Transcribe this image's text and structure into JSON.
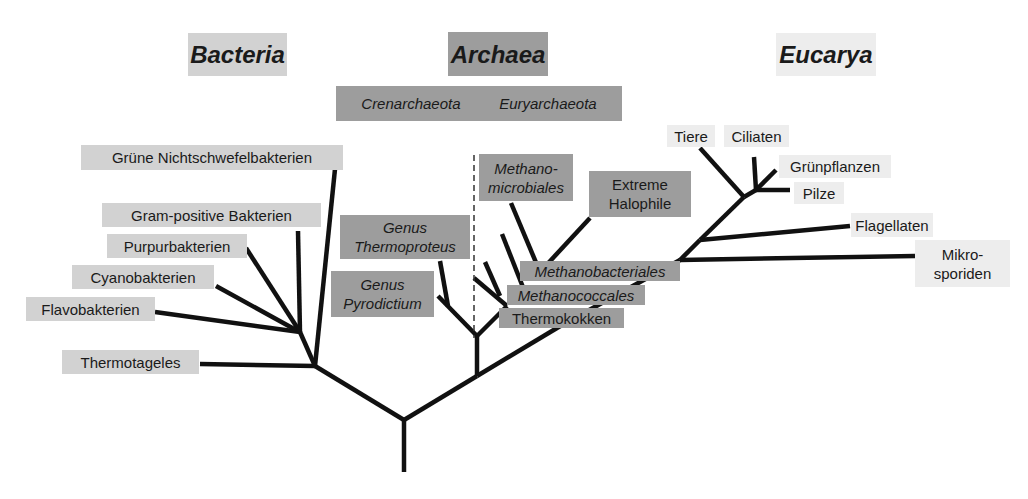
{
  "domains": {
    "bacteria": "Bacteria",
    "archaea": "Archaea",
    "eucarya": "Eucarya"
  },
  "archaea_groups": {
    "crenarchaeota": "Crenarchaeota",
    "euryarchaeota": "Euryarchaeota"
  },
  "bacteria_taxa": [
    "Grüne Nichtschwefelbakterien",
    "Gram-positive Bakterien",
    "Purpurbakterien",
    "Cyanobakterien",
    "Flavobakterien",
    "Thermotageles"
  ],
  "archaea_taxa": {
    "thermoproteus": [
      "Genus",
      "Thermoproteus"
    ],
    "pyrodictium": [
      "Genus",
      "Pyrodictium"
    ],
    "methanomicrobiales": [
      "Methano-",
      "microbiales"
    ],
    "halophile": [
      "Extreme",
      "Halophile"
    ],
    "methanobacteriales": "Methanobacteriales",
    "methanococcales": "Methanococcales",
    "thermokokken": "Thermokokken"
  },
  "eucarya_taxa": {
    "tiere": "Tiere",
    "ciliaten": "Ciliaten",
    "gruenpflanzen": "Grünpflanzen",
    "pilze": "Pilze",
    "flagellaten": "Flagellaten",
    "mikrosporiden": [
      "Mikro-",
      "sporiden"
    ]
  },
  "colors": {
    "bacteria_bg": "#d2d2d2",
    "archaea_bg": "#9d9d9d",
    "eucarya_bg": "#ededed",
    "line": "#111111"
  }
}
